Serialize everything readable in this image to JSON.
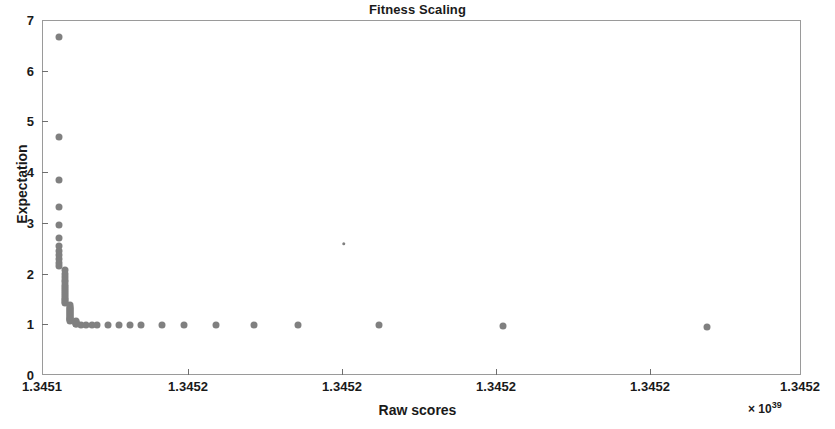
{
  "chart_data": {
    "type": "scatter",
    "title": "Fitness Scaling",
    "xlabel": "Raw scores",
    "ylabel": "Expectation",
    "x_exponent_prefix": "× 10",
    "x_exponent_power": "39",
    "grid": false,
    "legend": null,
    "marker_color": "#808080",
    "xlim": [
      1.3451,
      1.34524
    ],
    "ylim": [
      0,
      7
    ],
    "yticks": [
      0,
      1,
      2,
      3,
      4,
      5,
      6,
      7
    ],
    "ytick_labels": [
      "0",
      "1",
      "2",
      "3",
      "4",
      "5",
      "6",
      "7"
    ],
    "xticks": [
      1.3451,
      1.34512,
      1.34515,
      1.34517,
      1.34519,
      1.34522
    ],
    "xtick_labels": [
      "1.3451",
      "1.3452",
      "1.3452",
      "1.3452",
      "1.3452",
      "1.3452"
    ],
    "points": [
      {
        "x": 1.345103,
        "y": 6.68
      },
      {
        "x": 1.345103,
        "y": 4.72
      },
      {
        "x": 1.345103,
        "y": 3.86
      },
      {
        "x": 1.345103,
        "y": 3.34
      },
      {
        "x": 1.345103,
        "y": 2.98
      },
      {
        "x": 1.345103,
        "y": 2.73
      },
      {
        "x": 1.345103,
        "y": 2.56
      },
      {
        "x": 1.345103,
        "y": 2.46
      },
      {
        "x": 1.345103,
        "y": 2.38
      },
      {
        "x": 1.345103,
        "y": 2.3
      },
      {
        "x": 1.345103,
        "y": 2.23
      },
      {
        "x": 1.345103,
        "y": 2.16
      },
      {
        "x": 1.345104,
        "y": 2.09
      },
      {
        "x": 1.345104,
        "y": 2.02
      },
      {
        "x": 1.345104,
        "y": 1.96
      },
      {
        "x": 1.345104,
        "y": 1.9
      },
      {
        "x": 1.345104,
        "y": 1.85
      },
      {
        "x": 1.345104,
        "y": 1.8
      },
      {
        "x": 1.345104,
        "y": 1.75
      },
      {
        "x": 1.345104,
        "y": 1.71
      },
      {
        "x": 1.345104,
        "y": 1.67
      },
      {
        "x": 1.345104,
        "y": 1.63
      },
      {
        "x": 1.345104,
        "y": 1.59
      },
      {
        "x": 1.345104,
        "y": 1.56
      },
      {
        "x": 1.345104,
        "y": 1.52
      },
      {
        "x": 1.345104,
        "y": 1.49
      },
      {
        "x": 1.345104,
        "y": 1.46
      },
      {
        "x": 1.345104,
        "y": 1.43
      },
      {
        "x": 1.345105,
        "y": 1.4
      },
      {
        "x": 1.345105,
        "y": 1.37
      },
      {
        "x": 1.345105,
        "y": 1.35
      },
      {
        "x": 1.345105,
        "y": 1.32
      },
      {
        "x": 1.345105,
        "y": 1.3
      },
      {
        "x": 1.345105,
        "y": 1.28
      },
      {
        "x": 1.345105,
        "y": 1.26
      },
      {
        "x": 1.345105,
        "y": 1.24
      },
      {
        "x": 1.345105,
        "y": 1.22
      },
      {
        "x": 1.345105,
        "y": 1.2
      },
      {
        "x": 1.345105,
        "y": 1.18
      },
      {
        "x": 1.345105,
        "y": 1.16
      },
      {
        "x": 1.345105,
        "y": 1.15
      },
      {
        "x": 1.345105,
        "y": 1.13
      },
      {
        "x": 1.345105,
        "y": 1.12
      },
      {
        "x": 1.345105,
        "y": 1.1
      },
      {
        "x": 1.345105,
        "y": 1.09
      },
      {
        "x": 1.345106,
        "y": 1.08
      },
      {
        "x": 1.345106,
        "y": 1.06
      },
      {
        "x": 1.345106,
        "y": 1.05
      },
      {
        "x": 1.345106,
        "y": 1.04
      },
      {
        "x": 1.345106,
        "y": 1.03
      },
      {
        "x": 1.345106,
        "y": 1.02
      },
      {
        "x": 1.345107,
        "y": 1.01
      },
      {
        "x": 1.345108,
        "y": 1.01
      },
      {
        "x": 1.345109,
        "y": 1.0
      },
      {
        "x": 1.34511,
        "y": 1.0
      },
      {
        "x": 1.345112,
        "y": 1.0
      },
      {
        "x": 1.345114,
        "y": 1.0
      },
      {
        "x": 1.345116,
        "y": 1.0
      },
      {
        "x": 1.345118,
        "y": 1.0
      },
      {
        "x": 1.345122,
        "y": 1.0
      },
      {
        "x": 1.345126,
        "y": 1.0
      },
      {
        "x": 1.345132,
        "y": 1.0
      },
      {
        "x": 1.345139,
        "y": 1.0
      },
      {
        "x": 1.345147,
        "y": 1.0
      },
      {
        "x": 1.3451555,
        "y": 2.61
      },
      {
        "x": 1.345162,
        "y": 1.0
      },
      {
        "x": 1.3451848,
        "y": 0.99
      },
      {
        "x": 1.3452225,
        "y": 0.96
      }
    ]
  }
}
